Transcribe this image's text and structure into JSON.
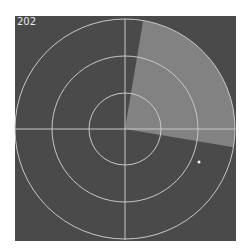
{
  "radar": {
    "label": "202",
    "center": [
      125,
      129
    ],
    "ring_radii": [
      36,
      73,
      110
    ],
    "sweep": {
      "start_deg": 9.5,
      "end_deg": 99.5,
      "color": "#8c8c8c"
    },
    "blip": {
      "x": 199,
      "y": 162
    },
    "colors": {
      "background": "#4a4a4a",
      "rings": "#c8c8c8",
      "blip": "#ffffff"
    }
  }
}
